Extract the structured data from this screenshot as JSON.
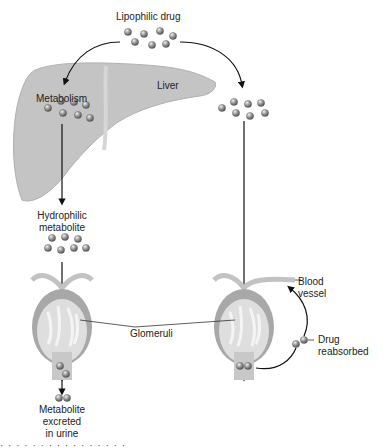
{
  "diagram": {
    "labels": {
      "lipophilic_drug": "Lipophilic drug",
      "liver": "Liver",
      "metabolism": "Metabolism",
      "hydrophilic_metabolite_1": "Hydrophilic",
      "hydrophilic_metabolite_2": "metabolite",
      "glomeruli": "Glomeruli",
      "blood_vessel_1": "Blood",
      "blood_vessel_2": "vessel",
      "drug_reabsorbed_1": "Drug",
      "drug_reabsorbed_2": "reabsorbed",
      "excreted_1": "Metabolite",
      "excreted_2": "excreted",
      "excreted_3": "in urine"
    },
    "caption_fragment": "· · ·  ·  ·   · ·   ·  ·  · ·  ·   ·  · ·  ·",
    "colors": {
      "liver_fill": "#c8c8c8",
      "molecule": "#8a8a8a",
      "kidney_outer": "#9e9e9e",
      "kidney_inner": "#d9d9d9",
      "arrow": "#111111"
    }
  }
}
